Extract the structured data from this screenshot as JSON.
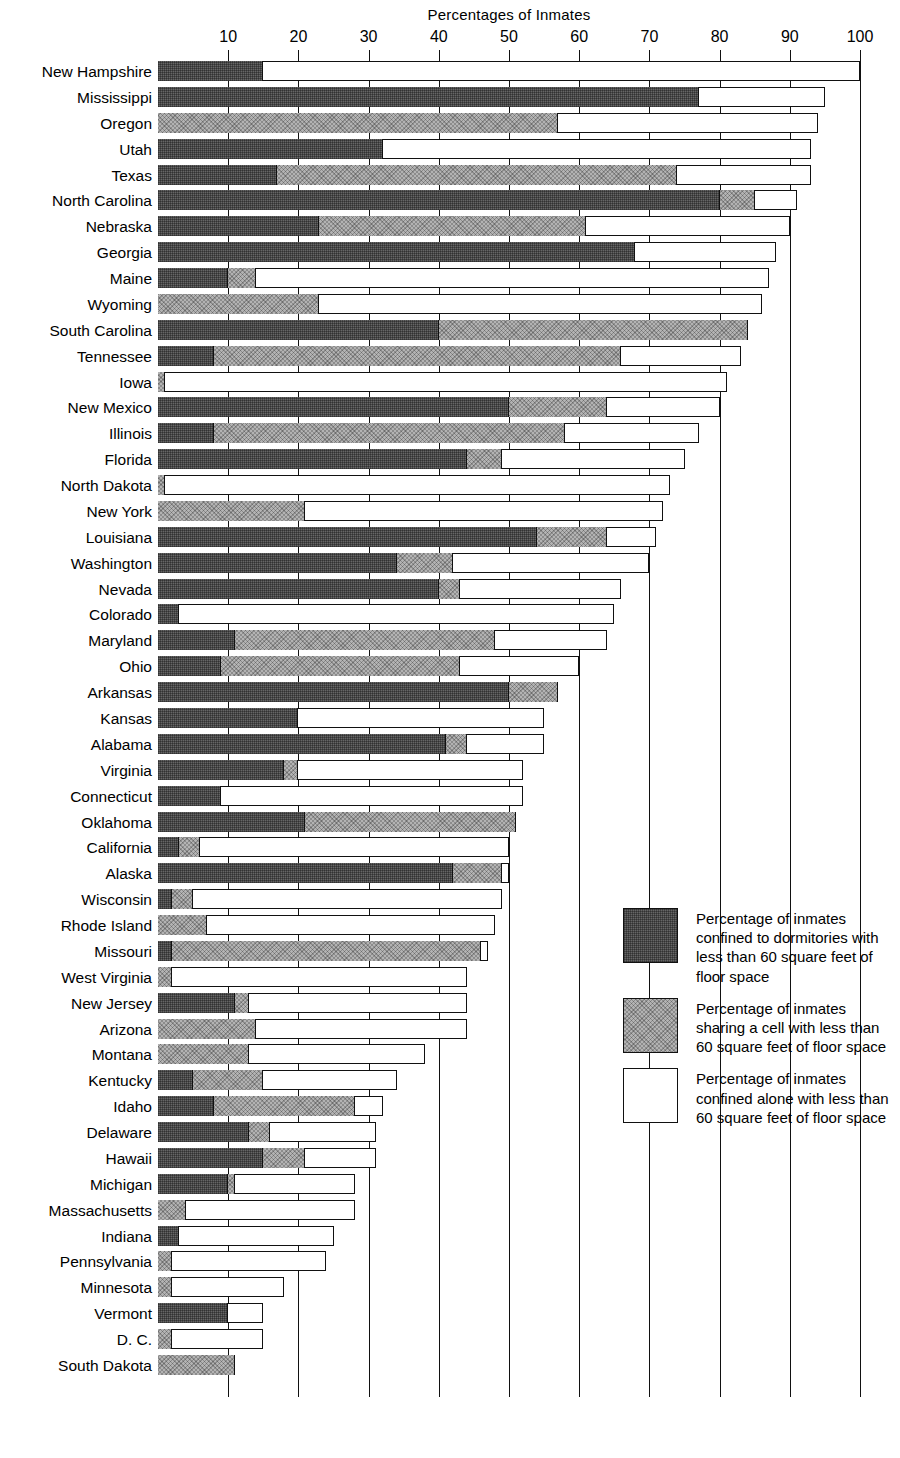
{
  "chart_data": {
    "type": "bar",
    "orientation": "horizontal",
    "stacked": true,
    "title": "Percentages of Inmates",
    "xlabel": "",
    "ylabel": "",
    "xlim": [
      0,
      100
    ],
    "xticks": [
      10,
      20,
      30,
      40,
      50,
      60,
      70,
      80,
      90,
      100
    ],
    "grid": true,
    "legend_position": "right-lower",
    "series": [
      {
        "name": "Percentage of inmates confined to dormitories with less than 60 square feet of floor space",
        "key": "dormitory",
        "color": "#666666"
      },
      {
        "name": "Percentage of inmates sharing a cell with less than 60 square feet of floor space",
        "key": "shared_cell",
        "color": "#b3b3b3"
      },
      {
        "name": "Percentage of inmates confined alone with less than 60 square feet of floor space",
        "key": "alone",
        "color": "#ffffff"
      }
    ],
    "categories": [
      "New Hampshire",
      "Mississippi",
      "Oregon",
      "Utah",
      "Texas",
      "North Carolina",
      "Nebraska",
      "Georgia",
      "Maine",
      "Wyoming",
      "South Carolina",
      "Tennessee",
      "Iowa",
      "New Mexico",
      "Illinois",
      "Florida",
      "North Dakota",
      "New York",
      "Louisiana",
      "Washington",
      "Nevada",
      "Colorado",
      "Maryland",
      "Ohio",
      "Arkansas",
      "Kansas",
      "Alabama",
      "Virginia",
      "Connecticut",
      "Oklahoma",
      "California",
      "Alaska",
      "Wisconsin",
      "Rhode Island",
      "Missouri",
      "West Virginia",
      "New Jersey",
      "Arizona",
      "Montana",
      "Kentucky",
      "Idaho",
      "Delaware",
      "Hawaii",
      "Michigan",
      "Massachusetts",
      "Indiana",
      "Pennsylvania",
      "Minnesota",
      "Vermont",
      "D. C.",
      "South Dakota"
    ],
    "rows": [
      {
        "state": "New Hampshire",
        "dormitory": 15,
        "shared_cell": 0,
        "alone": 85,
        "total": 100
      },
      {
        "state": "Mississippi",
        "dormitory": 77,
        "shared_cell": 0,
        "alone": 18,
        "total": 95
      },
      {
        "state": "Oregon",
        "dormitory": 0,
        "shared_cell": 57,
        "alone": 37,
        "total": 94
      },
      {
        "state": "Utah",
        "dormitory": 32,
        "shared_cell": 0,
        "alone": 61,
        "total": 93
      },
      {
        "state": "Texas",
        "dormitory": 17,
        "shared_cell": 74,
        "alone": 2,
        "total": 93
      },
      {
        "state": "North Carolina",
        "dormitory": 80,
        "shared_cell": 85,
        "alone": 6,
        "total": 91
      },
      {
        "state": "Nebraska",
        "dormitory": 23,
        "shared_cell": 61,
        "alone": 29,
        "total": 90
      },
      {
        "state": "Georgia",
        "dormitory": 68,
        "shared_cell": 0,
        "alone": 20,
        "total": 88
      },
      {
        "state": "Maine",
        "dormitory": 10,
        "shared_cell": 14,
        "alone": 73,
        "total": 87
      },
      {
        "state": "Wyoming",
        "dormitory": 0,
        "shared_cell": 23,
        "alone": 63,
        "total": 86
      },
      {
        "state": "South Carolina",
        "dormitory": 40,
        "shared_cell": 84,
        "alone": 0,
        "total": 84
      },
      {
        "state": "Tennessee",
        "dormitory": 8,
        "shared_cell": 66,
        "alone": 17,
        "total": 83
      },
      {
        "state": "Iowa",
        "dormitory": 0,
        "shared_cell": 1,
        "alone": 80,
        "total": 81
      },
      {
        "state": "New Mexico",
        "dormitory": 50,
        "shared_cell": 64,
        "alone": 16,
        "total": 80
      },
      {
        "state": "Illinois",
        "dormitory": 8,
        "shared_cell": 58,
        "alone": 19,
        "total": 77
      },
      {
        "state": "Florida",
        "dormitory": 44,
        "shared_cell": 49,
        "alone": 26,
        "total": 75
      },
      {
        "state": "North Dakota",
        "dormitory": 0,
        "shared_cell": 1,
        "alone": 72,
        "total": 73
      },
      {
        "state": "New York",
        "dormitory": 0,
        "shared_cell": 21,
        "alone": 51,
        "total": 72
      },
      {
        "state": "Louisiana",
        "dormitory": 54,
        "shared_cell": 64,
        "alone": 7,
        "total": 71
      },
      {
        "state": "Washington",
        "dormitory": 34,
        "shared_cell": 42,
        "alone": 28,
        "total": 70
      },
      {
        "state": "Nevada",
        "dormitory": 40,
        "shared_cell": 43,
        "alone": 23,
        "total": 66
      },
      {
        "state": "Colorado",
        "dormitory": 3,
        "shared_cell": 0,
        "alone": 62,
        "total": 65
      },
      {
        "state": "Maryland",
        "dormitory": 11,
        "shared_cell": 48,
        "alone": 16,
        "total": 64
      },
      {
        "state": "Ohio",
        "dormitory": 9,
        "shared_cell": 43,
        "alone": 17,
        "total": 60
      },
      {
        "state": "Arkansas",
        "dormitory": 50,
        "shared_cell": 57,
        "alone": 0,
        "total": 57
      },
      {
        "state": "Kansas",
        "dormitory": 20,
        "shared_cell": 0,
        "alone": 35,
        "total": 55
      },
      {
        "state": "Alabama",
        "dormitory": 41,
        "shared_cell": 44,
        "alone": 11,
        "total": 55
      },
      {
        "state": "Virginia",
        "dormitory": 18,
        "shared_cell": 20,
        "alone": 32,
        "total": 52
      },
      {
        "state": "Connecticut",
        "dormitory": 9,
        "shared_cell": 0,
        "alone": 43,
        "total": 52
      },
      {
        "state": "Oklahoma",
        "dormitory": 21,
        "shared_cell": 51,
        "alone": 0,
        "total": 51
      },
      {
        "state": "California",
        "dormitory": 3,
        "shared_cell": 6,
        "alone": 44,
        "total": 50
      },
      {
        "state": "Alaska",
        "dormitory": 42,
        "shared_cell": 49,
        "alone": 1,
        "total": 50
      },
      {
        "state": "Wisconsin",
        "dormitory": 2,
        "shared_cell": 5,
        "alone": 44,
        "total": 49
      },
      {
        "state": "Rhode Island",
        "dormitory": 0,
        "shared_cell": 7,
        "alone": 41,
        "total": 48
      },
      {
        "state": "Missouri",
        "dormitory": 2,
        "shared_cell": 46,
        "alone": 1,
        "total": 47
      },
      {
        "state": "West Virginia",
        "dormitory": 0,
        "shared_cell": 2,
        "alone": 42,
        "total": 44
      },
      {
        "state": "New Jersey",
        "dormitory": 11,
        "shared_cell": 13,
        "alone": 31,
        "total": 44
      },
      {
        "state": "Arizona",
        "dormitory": 0,
        "shared_cell": 14,
        "alone": 30,
        "total": 44
      },
      {
        "state": "Montana",
        "dormitory": 0,
        "shared_cell": 13,
        "alone": 25,
        "total": 38
      },
      {
        "state": "Kentucky",
        "dormitory": 5,
        "shared_cell": 15,
        "alone": 19,
        "total": 34
      },
      {
        "state": "Idaho",
        "dormitory": 8,
        "shared_cell": 28,
        "alone": 4,
        "total": 32
      },
      {
        "state": "Delaware",
        "dormitory": 13,
        "shared_cell": 16,
        "alone": 15,
        "total": 31
      },
      {
        "state": "Hawaii",
        "dormitory": 15,
        "shared_cell": 21,
        "alone": 10,
        "total": 31
      },
      {
        "state": "Michigan",
        "dormitory": 10,
        "shared_cell": 11,
        "alone": 17,
        "total": 28
      },
      {
        "state": "Massachusetts",
        "dormitory": 0,
        "shared_cell": 4,
        "alone": 24,
        "total": 28
      },
      {
        "state": "Indiana",
        "dormitory": 3,
        "shared_cell": 0,
        "alone": 22,
        "total": 25
      },
      {
        "state": "Pennsylvania",
        "dormitory": 0,
        "shared_cell": 2,
        "alone": 22,
        "total": 24
      },
      {
        "state": "Minnesota",
        "dormitory": 0,
        "shared_cell": 2,
        "alone": 16,
        "total": 18
      },
      {
        "state": "Vermont",
        "dormitory": 10,
        "shared_cell": 0,
        "alone": 5,
        "total": 15
      },
      {
        "state": "D. C.",
        "dormitory": 0,
        "shared_cell": 2,
        "alone": 13,
        "total": 15
      },
      {
        "state": "South Dakota",
        "dormitory": 0,
        "shared_cell": 11,
        "alone": 0,
        "total": 11
      }
    ]
  },
  "legend": {
    "items": [
      {
        "swatch": "dark",
        "text": "Percentage of inmates confined to dormitories with less than 60 square feet of floor space"
      },
      {
        "swatch": "mid",
        "text": "Percentage of inmates sharing a cell with less than 60 square feet of floor space"
      },
      {
        "swatch": "light",
        "text": "Percentage of inmates confined alone with less than 60 square feet of floor space"
      }
    ]
  }
}
